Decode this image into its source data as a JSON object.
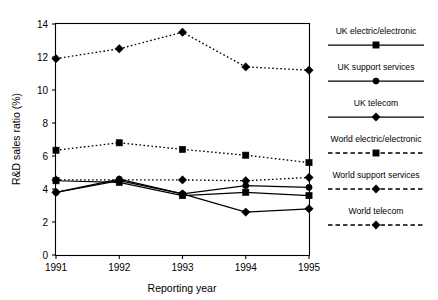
{
  "chart_data": {
    "type": "line",
    "title": "",
    "xlabel": "Reporting year",
    "ylabel": "R&D sales ratio (%)",
    "categories": [
      "1991",
      "1992",
      "1993",
      "1994",
      "1995"
    ],
    "x": [
      1991,
      1992,
      1993,
      1994,
      1995
    ],
    "xlim": [
      1991,
      1995
    ],
    "ylim": [
      0,
      14
    ],
    "yticks": [
      0,
      2,
      4,
      6,
      8,
      10,
      12,
      14
    ],
    "xticks": [
      "1991",
      "1992",
      "1993",
      "1994",
      "1995"
    ],
    "grid": false,
    "legend_position": "right",
    "series": [
      {
        "name": "UK electric/electronic",
        "marker": "square",
        "linestyle": "solid",
        "color": "#000000",
        "values": [
          4.5,
          4.4,
          3.6,
          3.8,
          3.6
        ]
      },
      {
        "name": "UK support services",
        "marker": "circle",
        "linestyle": "solid",
        "color": "#000000",
        "values": [
          3.8,
          4.6,
          3.7,
          4.2,
          4.1
        ]
      },
      {
        "name": "UK telecom",
        "marker": "diamond",
        "linestyle": "solid",
        "color": "#000000",
        "values": [
          3.8,
          4.5,
          3.7,
          2.6,
          2.8
        ]
      },
      {
        "name": "World electric/electronic",
        "marker": "square",
        "linestyle": "dashed",
        "color": "#000000",
        "values": [
          6.35,
          6.8,
          6.4,
          6.05,
          5.6
        ]
      },
      {
        "name": "World support services",
        "marker": "diamond",
        "linestyle": "dashed",
        "color": "#000000",
        "values": [
          4.55,
          4.55,
          4.55,
          4.5,
          4.7
        ]
      },
      {
        "name": "World telecom",
        "marker": "diamond",
        "linestyle": "dashed",
        "color": "#000000",
        "values": [
          11.9,
          12.5,
          13.5,
          11.4,
          11.2
        ]
      }
    ]
  },
  "axes": {
    "ylabel": "R&D sales ratio (%)",
    "xlabel": "Reporting year",
    "ytick_labels": [
      "0",
      "2",
      "4",
      "6",
      "8",
      "10",
      "12",
      "14"
    ],
    "xtick_labels": [
      "1991",
      "1992",
      "1993",
      "1994",
      "1995"
    ]
  },
  "legend": {
    "entries": [
      {
        "label": "UK electric/electronic",
        "marker": "square",
        "linestyle": "solid"
      },
      {
        "label": "UK support services",
        "marker": "circle",
        "linestyle": "solid"
      },
      {
        "label": "UK telecom",
        "marker": "diamond",
        "linestyle": "solid"
      },
      {
        "label": "World electric/electronic",
        "marker": "square",
        "linestyle": "dashed"
      },
      {
        "label": "World support services",
        "marker": "diamond",
        "linestyle": "dashed"
      },
      {
        "label": "World telecom",
        "marker": "diamond",
        "linestyle": "dashed"
      }
    ]
  }
}
